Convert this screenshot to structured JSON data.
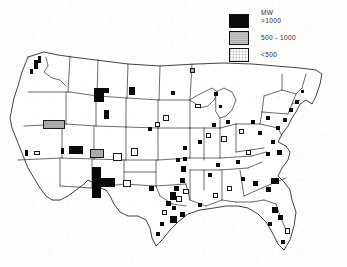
{
  "figure": {
    "background_color": "#fdfdfc",
    "outline_color": "#1d1d1d"
  },
  "legend": {
    "unit_label": "MW",
    "items": [
      {
        "label": ">1000",
        "swatch": "black",
        "color": "#0b0b0b"
      },
      {
        "label": "500  -  1000",
        "swatch": "gray",
        "color": "#adadad"
      },
      {
        "label": "<500",
        "swatch": "white",
        "color": "#fbfbfb"
      }
    ]
  },
  "map": {
    "region": "contiguous-united-states",
    "projection_hint": "albers-equal-area",
    "state_border_color": "#242424",
    "coastline_color": "#141414"
  },
  "chart_data": {
    "type": "map",
    "title": "",
    "unit": "MW",
    "classes": [
      {
        "name": ">1000",
        "min": 1000,
        "max": null,
        "fill": "#0b0b0b"
      },
      {
        "name": "500 - 1000",
        "min": 500,
        "max": 1000,
        "fill": "#adadad"
      },
      {
        "name": "<500",
        "min": 0,
        "max": 500,
        "fill": "#fbfbfb"
      }
    ],
    "markers": [
      {
        "x": 94,
        "y": 88,
        "w": 10,
        "h": 14,
        "cls": "big",
        "region": "wyoming"
      },
      {
        "x": 101,
        "y": 88,
        "w": 8,
        "h": 5,
        "cls": "big",
        "region": "wyoming-north"
      },
      {
        "x": 129,
        "y": 87,
        "w": 6,
        "h": 8,
        "cls": "big",
        "region": "south-dakota-west"
      },
      {
        "x": 104,
        "y": 110,
        "w": 5,
        "h": 9,
        "cls": "big",
        "region": "colorado-west"
      },
      {
        "x": 92,
        "y": 167,
        "w": 9,
        "h": 31,
        "cls": "big",
        "region": "new-mexico-arizona"
      },
      {
        "x": 101,
        "y": 178,
        "w": 14,
        "h": 9,
        "cls": "big",
        "region": "new-mexico-east"
      },
      {
        "x": 69,
        "y": 146,
        "w": 14,
        "h": 8,
        "cls": "big",
        "region": "arizona-north"
      },
      {
        "x": 43,
        "y": 120,
        "w": 22,
        "h": 9,
        "cls": "mid",
        "region": "nevada-north"
      },
      {
        "x": 90,
        "y": 149,
        "w": 14,
        "h": 9,
        "cls": "mid",
        "region": "four-corners"
      },
      {
        "x": 113,
        "y": 153,
        "w": 9,
        "h": 8,
        "cls": "small",
        "region": "colorado-south"
      },
      {
        "x": 131,
        "y": 148,
        "w": 7,
        "h": 8,
        "cls": "small",
        "region": "kansas-west"
      },
      {
        "x": 123,
        "y": 180,
        "w": 8,
        "h": 7,
        "cls": "small",
        "region": "texas-panhandle"
      },
      {
        "x": 34,
        "y": 60,
        "w": 4,
        "h": 9,
        "cls": "big",
        "region": "washington-columbia"
      },
      {
        "x": 38,
        "y": 56,
        "w": 3,
        "h": 7,
        "cls": "big",
        "region": "washington-north"
      },
      {
        "x": 30,
        "y": 69,
        "w": 3,
        "h": 5,
        "cls": "big",
        "region": "oregon-north"
      },
      {
        "x": 25,
        "y": 150,
        "w": 3,
        "h": 6,
        "cls": "big",
        "region": "california-north"
      },
      {
        "x": 34,
        "y": 151,
        "w": 6,
        "h": 4,
        "cls": "small",
        "region": "california-central"
      },
      {
        "x": 61,
        "y": 148,
        "w": 3,
        "h": 6,
        "cls": "big",
        "region": "nevada-south"
      },
      {
        "x": 163,
        "y": 115,
        "w": 6,
        "h": 6,
        "cls": "small",
        "region": "nebraska"
      },
      {
        "x": 155,
        "y": 122,
        "w": 5,
        "h": 5,
        "cls": "small",
        "region": "nebraska-east"
      },
      {
        "x": 148,
        "y": 127,
        "w": 4,
        "h": 4,
        "cls": "dot",
        "region": "iowa-west"
      },
      {
        "x": 171,
        "y": 91,
        "w": 4,
        "h": 4,
        "cls": "dot",
        "region": "minnesota"
      },
      {
        "x": 190,
        "y": 68,
        "w": 5,
        "h": 5,
        "cls": "mid",
        "region": "minnesota-north"
      },
      {
        "x": 195,
        "y": 104,
        "w": 6,
        "h": 4,
        "cls": "small",
        "region": "wisconsin"
      },
      {
        "x": 214,
        "y": 92,
        "w": 4,
        "h": 4,
        "cls": "dot",
        "region": "michigan-upper"
      },
      {
        "x": 219,
        "y": 105,
        "w": 3,
        "h": 3,
        "cls": "dot",
        "region": "michigan-west"
      },
      {
        "x": 226,
        "y": 120,
        "w": 4,
        "h": 4,
        "cls": "dot",
        "region": "michigan-south"
      },
      {
        "x": 212,
        "y": 123,
        "w": 4,
        "h": 4,
        "cls": "dot",
        "region": "illinois-north"
      },
      {
        "x": 206,
        "y": 133,
        "w": 5,
        "h": 5,
        "cls": "small",
        "region": "illinois"
      },
      {
        "x": 198,
        "y": 140,
        "w": 4,
        "h": 4,
        "cls": "dot",
        "region": "missouri-east"
      },
      {
        "x": 183,
        "y": 146,
        "w": 4,
        "h": 4,
        "cls": "dot",
        "region": "missouri"
      },
      {
        "x": 176,
        "y": 158,
        "w": 4,
        "h": 4,
        "cls": "dot",
        "region": "missouri-south"
      },
      {
        "x": 221,
        "y": 136,
        "w": 6,
        "h": 6,
        "cls": "small",
        "region": "indiana"
      },
      {
        "x": 239,
        "y": 129,
        "w": 5,
        "h": 5,
        "cls": "small",
        "region": "ohio"
      },
      {
        "x": 251,
        "y": 120,
        "w": 4,
        "h": 4,
        "cls": "dot",
        "region": "ohio-east"
      },
      {
        "x": 258,
        "y": 131,
        "w": 4,
        "h": 4,
        "cls": "dot",
        "region": "pennsylvania-west"
      },
      {
        "x": 266,
        "y": 116,
        "w": 4,
        "h": 4,
        "cls": "dot",
        "region": "pennsylvania"
      },
      {
        "x": 276,
        "y": 126,
        "w": 4,
        "h": 4,
        "cls": "dot",
        "region": "new-jersey"
      },
      {
        "x": 283,
        "y": 118,
        "w": 4,
        "h": 4,
        "cls": "dot",
        "region": "new-york-east"
      },
      {
        "x": 289,
        "y": 108,
        "w": 4,
        "h": 4,
        "cls": "dot",
        "region": "connecticut"
      },
      {
        "x": 295,
        "y": 100,
        "w": 4,
        "h": 4,
        "cls": "dot",
        "region": "massachusetts"
      },
      {
        "x": 301,
        "y": 90,
        "w": 3,
        "h": 3,
        "cls": "dot",
        "region": "new-hampshire"
      },
      {
        "x": 271,
        "y": 140,
        "w": 4,
        "h": 4,
        "cls": "dot",
        "region": "maryland"
      },
      {
        "x": 266,
        "y": 152,
        "w": 4,
        "h": 4,
        "cls": "dot",
        "region": "virginia"
      },
      {
        "x": 277,
        "y": 150,
        "w": 5,
        "h": 5,
        "cls": "dot",
        "region": "virginia-coast"
      },
      {
        "x": 246,
        "y": 150,
        "w": 5,
        "h": 5,
        "cls": "small",
        "region": "west-virginia"
      },
      {
        "x": 236,
        "y": 160,
        "w": 4,
        "h": 4,
        "cls": "dot",
        "region": "kentucky"
      },
      {
        "x": 216,
        "y": 163,
        "w": 4,
        "h": 4,
        "cls": "dot",
        "region": "kentucky-west"
      },
      {
        "x": 208,
        "y": 173,
        "w": 4,
        "h": 4,
        "cls": "dot",
        "region": "tennessee-west"
      },
      {
        "x": 227,
        "y": 186,
        "w": 5,
        "h": 5,
        "cls": "small",
        "region": "alabama-north"
      },
      {
        "x": 241,
        "y": 177,
        "w": 4,
        "h": 4,
        "cls": "dot",
        "region": "georgia-north"
      },
      {
        "x": 253,
        "y": 181,
        "w": 5,
        "h": 5,
        "cls": "dot",
        "region": "south-carolina"
      },
      {
        "x": 271,
        "y": 178,
        "w": 8,
        "h": 6,
        "cls": "big",
        "region": "south-carolina-coast"
      },
      {
        "x": 266,
        "y": 187,
        "w": 5,
        "h": 5,
        "cls": "dot",
        "region": "georgia-coast"
      },
      {
        "x": 213,
        "y": 193,
        "w": 5,
        "h": 5,
        "cls": "small",
        "region": "mississippi"
      },
      {
        "x": 198,
        "y": 203,
        "w": 4,
        "h": 4,
        "cls": "dot",
        "region": "louisiana-east"
      },
      {
        "x": 272,
        "y": 207,
        "w": 6,
        "h": 6,
        "cls": "dot",
        "region": "florida-north"
      },
      {
        "x": 278,
        "y": 215,
        "w": 5,
        "h": 5,
        "cls": "dot",
        "region": "florida-central"
      },
      {
        "x": 268,
        "y": 222,
        "w": 4,
        "h": 4,
        "cls": "dot",
        "region": "florida-gulf"
      },
      {
        "x": 285,
        "y": 228,
        "w": 5,
        "h": 6,
        "cls": "small",
        "region": "florida-east"
      },
      {
        "x": 281,
        "y": 240,
        "w": 4,
        "h": 4,
        "cls": "dot",
        "region": "florida-south"
      },
      {
        "x": 180,
        "y": 212,
        "w": 5,
        "h": 5,
        "cls": "dot",
        "region": "louisiana"
      },
      {
        "x": 172,
        "y": 206,
        "w": 4,
        "h": 4,
        "cls": "dot",
        "region": "louisiana-west"
      },
      {
        "x": 176,
        "y": 196,
        "w": 6,
        "h": 6,
        "cls": "small",
        "region": "arkansas-south"
      },
      {
        "x": 183,
        "y": 189,
        "w": 6,
        "h": 5,
        "cls": "small",
        "region": "arkansas"
      },
      {
        "x": 174,
        "y": 186,
        "w": 5,
        "h": 5,
        "cls": "big",
        "region": "texas-northeast"
      },
      {
        "x": 170,
        "y": 192,
        "w": 6,
        "h": 8,
        "cls": "big",
        "region": "texas-east"
      },
      {
        "x": 166,
        "y": 201,
        "w": 5,
        "h": 5,
        "cls": "dot",
        "region": "texas-east-2"
      },
      {
        "x": 162,
        "y": 210,
        "w": 5,
        "h": 5,
        "cls": "small",
        "region": "texas-southeast"
      },
      {
        "x": 170,
        "y": 216,
        "w": 7,
        "h": 7,
        "cls": "big",
        "region": "texas-houston"
      },
      {
        "x": 160,
        "y": 222,
        "w": 4,
        "h": 4,
        "cls": "dot",
        "region": "texas-gulf"
      },
      {
        "x": 156,
        "y": 232,
        "w": 4,
        "h": 4,
        "cls": "dot",
        "region": "texas-coast"
      },
      {
        "x": 149,
        "y": 186,
        "w": 5,
        "h": 5,
        "cls": "dot",
        "region": "texas-north"
      },
      {
        "x": 180,
        "y": 178,
        "w": 5,
        "h": 5,
        "cls": "dot",
        "region": "oklahoma-east"
      },
      {
        "x": 181,
        "y": 166,
        "w": 5,
        "h": 6,
        "cls": "dot",
        "region": "oklahoma"
      },
      {
        "x": 183,
        "y": 157,
        "w": 4,
        "h": 4,
        "cls": "dot",
        "region": "kansas-south"
      }
    ]
  }
}
